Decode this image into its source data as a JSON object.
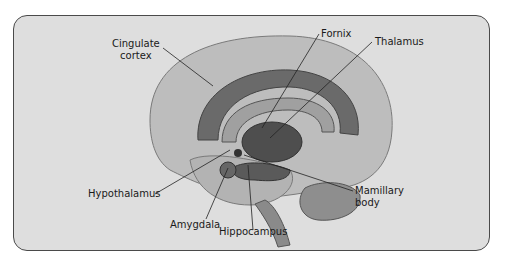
{
  "figure": {
    "colors": {
      "background": "#dedede",
      "frame": "#4a4a4a",
      "brain": "#b8b8b8",
      "limbic_dark": "#5e5e5e",
      "limbic_mid": "#8a8a8a",
      "leader_line": "#222222"
    }
  },
  "labels": {
    "cingulate_1": "Cingulate",
    "cingulate_2": "cortex",
    "fornix": "Fornix",
    "thalamus": "Thalamus",
    "hypothalamus": "Hypothalamus",
    "amygdala": "Amygdala",
    "hippocampus": "Hippocampus",
    "mamillary_1": "Mamillary",
    "mamillary_2": "body"
  }
}
